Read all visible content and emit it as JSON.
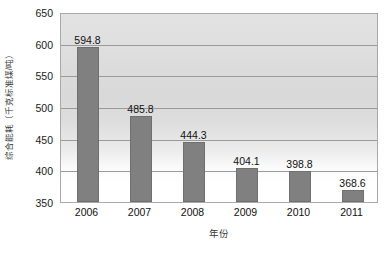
{
  "chart_data": {
    "type": "bar",
    "title": "",
    "subtitle": "",
    "xlabel": "年份",
    "ylabel": "综合能耗（千克标准煤/吨）",
    "categories": [
      "2006",
      "2007",
      "2008",
      "2009",
      "2010",
      "2011"
    ],
    "values": [
      594.8,
      485.8,
      444.3,
      404.1,
      398.8,
      368.6
    ],
    "value_labels": [
      "594.8",
      "485.8",
      "444.3",
      "404.1",
      "398.8",
      "368.6"
    ],
    "ylim": [
      350,
      650
    ],
    "yticks": [
      350,
      400,
      450,
      500,
      550,
      600,
      650
    ],
    "ytick_labels": [
      "350",
      "400",
      "450",
      "500",
      "550",
      "600",
      "650"
    ],
    "grid": true,
    "grid_axis": "y",
    "legend": false,
    "legend_position": "none",
    "bar_color": "#808080",
    "plot_border_color": "#a9a9a9",
    "gridline_color": "#9a9a9a",
    "background_color": "#ffffff"
  }
}
